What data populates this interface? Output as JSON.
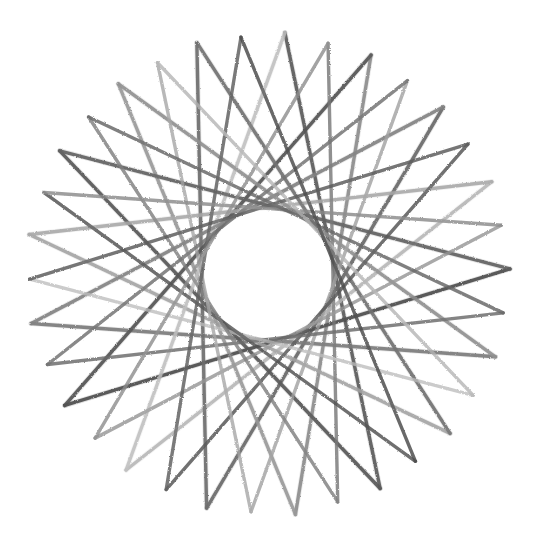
{
  "artwork": {
    "title": "Star Polygon Chord Figure",
    "medium": "pencil-on-paper line drawing",
    "background_color": "#ffffff",
    "frame": {
      "name": "border-rectangle",
      "x": 13,
      "y": 8,
      "width": 511,
      "height": 528,
      "stroke_color": "#3a3a3a",
      "stroke_width": 1
    }
  },
  "chart_data": {
    "type": "scatter",
    "subtitle": "17-point star polygon {17/7} drawn with graded pencil strokes",
    "xlabel": "",
    "ylabel": "",
    "grid": false,
    "legend": "none",
    "xlim": [
      13,
      524
    ],
    "ylim": [
      8,
      536
    ],
    "geometry": {
      "center_x": 268,
      "center_y": 274,
      "outer_radius": 242,
      "inner_void_radius": 73,
      "vertex_count": 17,
      "chord_skip": 7,
      "start_angle_deg": -86,
      "stroke_width": 3.4,
      "stroke_linecap": "round"
    },
    "categories": [
      "v0",
      "v1",
      "v2",
      "v3",
      "v4",
      "v5",
      "v6",
      "v7",
      "v8",
      "v9",
      "v10",
      "v11",
      "v12",
      "v13",
      "v14",
      "v15",
      "v16"
    ],
    "values": [
      242,
      242,
      242,
      242,
      242,
      242,
      242,
      242,
      242,
      242,
      242,
      242,
      242,
      242,
      242,
      242,
      242
    ],
    "vertex_angles_deg": [
      -86.0,
      -64.8,
      -43.6,
      -22.4,
      -1.2,
      20.0,
      41.2,
      62.4,
      83.5,
      104.7,
      125.9,
      147.1,
      168.2,
      189.4,
      210.6,
      231.8,
      252.9
    ],
    "stroke_shades": [
      "#5d5d5d",
      "#8e8e8e",
      "#6a6a6a",
      "#b9b9b9",
      "#4f4f4f",
      "#7d7d7d",
      "#a6a6a6",
      "#585858",
      "#9a9a9a",
      "#6f6f6f",
      "#c2c2c2",
      "#555555",
      "#848484",
      "#ababab",
      "#636363",
      "#939393",
      "#747474"
    ],
    "shade_legend": [
      {
        "label": "darkest stroke",
        "color": "#4f4f4f"
      },
      {
        "label": "mid stroke",
        "color": "#8e8e8e"
      },
      {
        "label": "lightest stroke",
        "color": "#c2c2c2"
      }
    ],
    "annotations": [
      {
        "text": "inner circular void (chord envelope)",
        "x": 268,
        "y": 274
      },
      {
        "text": "outer star tips on circumscribed circle",
        "x": 268,
        "y": 32
      }
    ]
  }
}
